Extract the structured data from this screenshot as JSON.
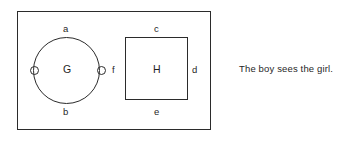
{
  "diagram": {
    "type": "linguistic-set-diagram",
    "outer_frame": {
      "name": "outer-rectangle",
      "label": ""
    },
    "shapes": [
      {
        "id": "G",
        "kind": "circle",
        "label": "G"
      },
      {
        "id": "H",
        "kind": "square",
        "label": "H"
      }
    ],
    "edge_labels": {
      "a": "a",
      "b": "b",
      "c": "c",
      "d": "d",
      "e": "e",
      "f": "f"
    },
    "nodes": [
      {
        "id": "node-left",
        "label": ""
      },
      {
        "id": "node-right",
        "label": ""
      }
    ],
    "caption": "The boy sees the girl."
  },
  "colors": {
    "stroke": "#2b2b2b",
    "text": "#1f1f1f",
    "background": "#ffffff"
  }
}
